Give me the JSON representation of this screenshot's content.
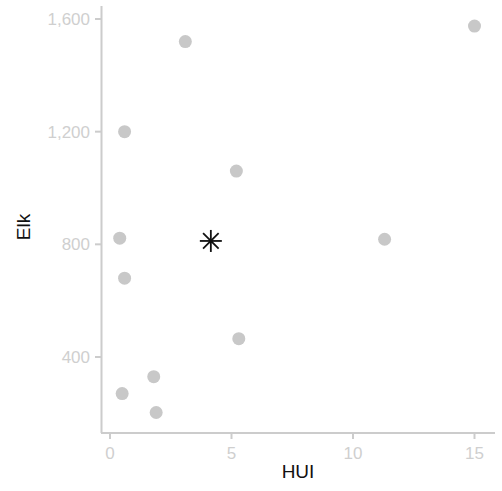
{
  "chart_data": {
    "type": "scatter",
    "title": "",
    "xlabel": "HUI",
    "ylabel": "Elk",
    "xlim": [
      -0.4,
      15.6
    ],
    "ylim": [
      130,
      1640
    ],
    "x_ticks": [
      0,
      5,
      10,
      15
    ],
    "x_tick_labels": [
      "0",
      "5",
      "10",
      "15"
    ],
    "y_ticks": [
      400,
      800,
      1200,
      1600
    ],
    "y_tick_labels": [
      "400",
      "800",
      "1,200",
      "1,600"
    ],
    "grid": false,
    "legend": null,
    "series": [
      {
        "name": "points",
        "marker": "circle",
        "color": "#c8c8c8",
        "points": [
          {
            "x": 0.6,
            "y": 1200
          },
          {
            "x": 3.1,
            "y": 1520
          },
          {
            "x": 15.0,
            "y": 1575
          },
          {
            "x": 5.2,
            "y": 1060
          },
          {
            "x": 0.4,
            "y": 822
          },
          {
            "x": 11.3,
            "y": 818
          },
          {
            "x": 0.6,
            "y": 680
          },
          {
            "x": 5.3,
            "y": 465
          },
          {
            "x": 1.8,
            "y": 330
          },
          {
            "x": 0.5,
            "y": 270
          },
          {
            "x": 1.9,
            "y": 203
          }
        ]
      },
      {
        "name": "highlight",
        "marker": "asterisk",
        "color": "#111111",
        "points": [
          {
            "x": 4.15,
            "y": 812
          }
        ]
      }
    ]
  },
  "colors": {
    "axis": "#cccccc",
    "tick_label": "#cfcfcf",
    "axis_title": "#111111",
    "point": "#c8c8c8",
    "highlight": "#111111"
  }
}
